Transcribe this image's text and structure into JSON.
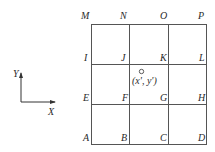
{
  "diagram": {
    "grid": {
      "rows": 3,
      "cols": 3,
      "line_color": "#555555",
      "node_labels": {
        "top": [
          "M",
          "N",
          "O",
          "P"
        ],
        "row2": [
          "I",
          "J",
          "K",
          "L"
        ],
        "row3": [
          "E",
          "F",
          "G",
          "H"
        ],
        "bottom": [
          "A",
          "B",
          "C",
          "D"
        ]
      }
    },
    "point": {
      "label": "(x', y')",
      "marker": "small-circle"
    },
    "axes": {
      "x_label": "X",
      "y_label": "Y"
    }
  }
}
